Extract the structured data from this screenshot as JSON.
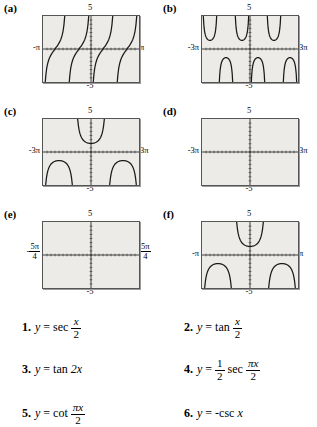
{
  "panels": [
    {
      "letter": "(a)",
      "top_label": "5",
      "bottom_label": "-5",
      "left_label": "-π",
      "right_label": "π",
      "left_is_fraction": false,
      "right_is_fraction": false,
      "curve_type": "cot",
      "branches": 4,
      "xmin": -3.14159,
      "xmax": 3.14159,
      "ymin": -5,
      "ymax": 5
    },
    {
      "letter": "(b)",
      "top_label": "5",
      "bottom_label": "-5",
      "left_label": "-3π",
      "right_label": "3π",
      "left_is_fraction": false,
      "right_is_fraction": false,
      "curve_type": "sec",
      "branches": 6,
      "xmin": -9.42478,
      "xmax": 9.42478,
      "ymin": -5,
      "ymax": 5
    },
    {
      "letter": "(c)",
      "top_label": "5",
      "bottom_label": "-5",
      "left_label": "-3π",
      "right_label": "3π",
      "left_is_fraction": false,
      "right_is_fraction": false,
      "curve_type": "sec-wide",
      "branches": 3,
      "xmin": -9.42478,
      "xmax": 9.42478,
      "ymin": -5,
      "ymax": 5
    },
    {
      "letter": "(d)",
      "top_label": "5",
      "bottom_label": "-5",
      "left_label": "-3π",
      "right_label": "3π",
      "left_is_fraction": false,
      "right_is_fraction": false,
      "curve_type": "tan",
      "branches": 3,
      "xmin": -9.42478,
      "xmax": 9.42478,
      "ymin": -5,
      "ymax": 5
    },
    {
      "letter": "(e)",
      "top_label": "5",
      "bottom_label": "-5",
      "left_label": "-5π/4",
      "left_fraction": {
        "sign": "-",
        "numerator": "5π",
        "denominator": "4"
      },
      "right_label": "5π/4",
      "right_fraction": {
        "sign": "",
        "numerator": "5π",
        "denominator": "4"
      },
      "left_is_fraction": true,
      "right_is_fraction": true,
      "curve_type": "tan-dense",
      "branches": 5,
      "xmin": -3.92699,
      "xmax": 3.92699,
      "ymin": -5,
      "ymax": 5
    },
    {
      "letter": "(f)",
      "top_label": "5",
      "bottom_label": "-5",
      "left_label": "-π",
      "right_label": "π",
      "left_is_fraction": false,
      "right_is_fraction": false,
      "curve_type": "negcsc",
      "branches": 3,
      "xmin": -3.14159,
      "xmax": 3.14159,
      "ymin": -5,
      "ymax": 5
    }
  ],
  "equations": [
    {
      "number": "1.",
      "lhs": "y",
      "equals": "=",
      "func": "sec",
      "arg_type": "fraction",
      "arg_numerator": "x",
      "arg_denominator": "2",
      "coefficient": "",
      "plain": "y = sec x/2"
    },
    {
      "number": "2.",
      "lhs": "y",
      "equals": "=",
      "func": "tan",
      "arg_type": "fraction",
      "arg_numerator": "x",
      "arg_denominator": "2",
      "coefficient": "",
      "plain": "y = tan x/2"
    },
    {
      "number": "3.",
      "lhs": "y",
      "equals": "=",
      "func": "tan",
      "arg_type": "plain",
      "arg_text": "2x",
      "coefficient": "",
      "plain": "y = tan 2x"
    },
    {
      "number": "4.",
      "lhs": "y",
      "equals": "=",
      "func": "sec",
      "arg_type": "fraction",
      "arg_numerator": "πx",
      "arg_denominator": "2",
      "coefficient": "1/2",
      "coef_numerator": "1",
      "coef_denominator": "2",
      "plain": "y = 1/2 sec πx/2"
    },
    {
      "number": "5.",
      "lhs": "y",
      "equals": "=",
      "func": "cot",
      "arg_type": "fraction",
      "arg_numerator": "πx",
      "arg_denominator": "2",
      "coefficient": "",
      "plain": "y = cot πx/2"
    },
    {
      "number": "6.",
      "lhs": "y",
      "equals": "=",
      "func": "csc",
      "arg_type": "plain",
      "arg_text": "x",
      "coefficient": "",
      "sign": "-",
      "plain": "y = -csc x"
    }
  ]
}
